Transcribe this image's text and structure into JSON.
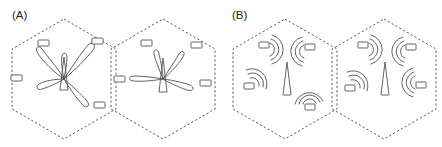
{
  "figure": {
    "width": 442,
    "height": 147,
    "background": "#ffffff",
    "stroke_color": "#4a4a4a",
    "label_color": "#1a1a1a"
  },
  "panels": [
    {
      "id": "panel-a",
      "label": "(A)",
      "label_x": 12,
      "label_y": 18,
      "description": "beamforming",
      "cells": [
        {
          "id": "cell-a-left",
          "center_x": 64,
          "center_y": 79,
          "radius_x": 52,
          "radius_y": 60,
          "tower": {
            "x": 64,
            "y": 79
          },
          "beams": [
            {
              "angle": -118,
              "length": 32,
              "width": 9
            },
            {
              "angle": -48,
              "length": 38,
              "width": 10
            },
            {
              "angle": -86,
              "length": 20,
              "width": 6
            },
            {
              "angle": 178,
              "length": 24,
              "width": 8
            },
            {
              "angle": 50,
              "length": 33,
              "width": 10
            }
          ],
          "devices": [
            {
              "x": 43,
              "y": 44
            },
            {
              "x": 97,
              "y": 42
            },
            {
              "x": 16,
              "y": 78
            },
            {
              "x": 99,
              "y": 105
            }
          ]
        },
        {
          "id": "cell-a-right",
          "center_x": 163,
          "center_y": 79,
          "radius_x": 52,
          "radius_y": 60,
          "tower": {
            "x": 163,
            "y": 79
          },
          "beams": [
            {
              "angle": -112,
              "length": 24,
              "width": 8
            },
            {
              "angle": -52,
              "length": 28,
              "width": 9
            },
            {
              "angle": 176,
              "length": 30,
              "width": 9
            },
            {
              "angle": 10,
              "length": 32,
              "width": 10
            }
          ],
          "devices": [
            {
              "x": 146,
              "y": 44
            },
            {
              "x": 196,
              "y": 45
            },
            {
              "x": 119,
              "y": 79
            },
            {
              "x": 205,
              "y": 83
            }
          ]
        }
      ]
    },
    {
      "id": "panel-b",
      "label": "(B)",
      "label_x": 232,
      "label_y": 18,
      "description": "omnidirectional",
      "cells": [
        {
          "id": "cell-b-left",
          "center_x": 285,
          "center_y": 79,
          "radius_x": 52,
          "radius_y": 60,
          "tower": {
            "x": 285,
            "y": 79
          },
          "beams": [],
          "nodes": [
            {
              "x": 265,
              "y": 50,
              "orientation": "right"
            },
            {
              "x": 303,
              "y": 52,
              "orientation": "left"
            },
            {
              "x": 250,
              "y": 78,
              "orientation": "upright"
            },
            {
              "x": 303,
              "y": 101,
              "orientation": "up"
            }
          ],
          "devices": []
        },
        {
          "id": "cell-b-right",
          "center_x": 384,
          "center_y": 79,
          "radius_x": 52,
          "radius_y": 60,
          "tower": {
            "x": 384,
            "y": 79
          },
          "beams": [],
          "nodes": [
            {
              "x": 364,
              "y": 50,
              "orientation": "right"
            },
            {
              "x": 404,
              "y": 52,
              "orientation": "left"
            },
            {
              "x": 351,
              "y": 80,
              "orientation": "upright"
            },
            {
              "x": 414,
              "y": 80,
              "orientation": "left"
            }
          ],
          "devices": []
        }
      ]
    }
  ],
  "legend": {
    "device_label": "user-device",
    "tower_label": "base-station-antenna",
    "beam_label": "directional-beam-lobe",
    "wave_label": "omnidirectional-signal-wave"
  }
}
